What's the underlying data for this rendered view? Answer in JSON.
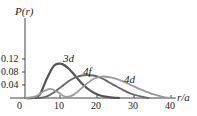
{
  "chart_data": {
    "type": "line",
    "title": "",
    "ylabel": "P(r)",
    "xlabel": "r/a",
    "xlim": [
      0,
      42
    ],
    "ylim": [
      0,
      0.14
    ],
    "x_ticks": [
      "0",
      "10",
      "20",
      "30",
      "40"
    ],
    "y_ticks": [
      "0.04",
      "0.08",
      "0.12"
    ],
    "grid": false,
    "legend": "inline labels",
    "series": [
      {
        "name": "3d",
        "color": "#555555",
        "x": [
          0,
          2,
          4,
          6,
          8,
          10,
          12,
          14,
          16,
          18,
          20,
          22,
          24,
          26
        ],
        "values": [
          0,
          0.0,
          0.01,
          0.06,
          0.1,
          0.105,
          0.09,
          0.065,
          0.04,
          0.022,
          0.01,
          0.004,
          0.001,
          0
        ]
      },
      {
        "name": "4f",
        "color": "#666666",
        "x": [
          0,
          4,
          6,
          8,
          10,
          12,
          14,
          16,
          18,
          20,
          22,
          24,
          26,
          28,
          30,
          32,
          34
        ],
        "values": [
          0,
          0.0,
          0.005,
          0.018,
          0.035,
          0.052,
          0.064,
          0.07,
          0.07,
          0.066,
          0.055,
          0.042,
          0.03,
          0.018,
          0.01,
          0.004,
          0
        ]
      },
      {
        "name": "4d",
        "color": "#999999",
        "x": [
          0,
          3,
          5,
          7,
          9,
          11,
          13,
          15,
          17,
          19,
          21,
          23,
          26,
          29,
          32,
          35,
          38,
          40
        ],
        "values": [
          0,
          0.005,
          0.02,
          0.028,
          0.018,
          0.004,
          0.008,
          0.025,
          0.045,
          0.06,
          0.066,
          0.064,
          0.055,
          0.04,
          0.025,
          0.012,
          0.003,
          0
        ]
      }
    ],
    "annotations": [
      "3d",
      "4f",
      "4d"
    ]
  },
  "labels": {
    "ylabel_text": "P(r)",
    "xlabel_text": "r/a",
    "series_3d": "3d",
    "series_4f": "4f",
    "series_4d": "4d"
  }
}
